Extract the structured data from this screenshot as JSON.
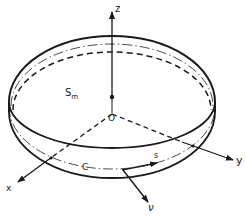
{
  "figure": {
    "type": "3D schematic of a thin circular plate/disk with coordinate system",
    "labels": {
      "z_axis": "z",
      "x_axis": "x",
      "y_axis": "y",
      "origin": "O",
      "midsurface": "S",
      "midsurface_sub": "m",
      "contour": "C",
      "arc_length": "s",
      "normal": "ν"
    },
    "colors": {
      "line": "#1a1a1a",
      "background": "#ffffff"
    }
  }
}
